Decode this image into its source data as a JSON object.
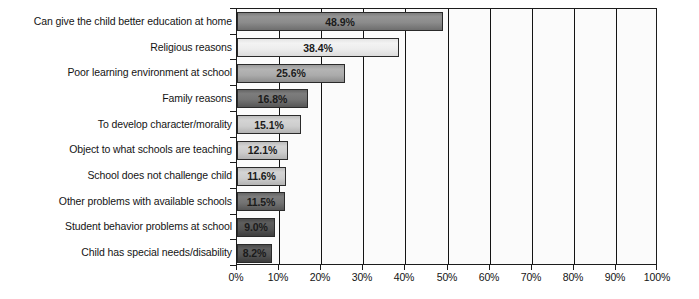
{
  "chart_data": {
    "type": "bar",
    "orientation": "horizontal",
    "title": "",
    "xlabel": "",
    "ylabel": "",
    "xlim": [
      0,
      100
    ],
    "xtick_labels": [
      "0%",
      "10%",
      "20%",
      "30%",
      "40%",
      "50%",
      "60%",
      "70%",
      "80%",
      "90%",
      "100%"
    ],
    "xtick_values": [
      0,
      10,
      20,
      30,
      40,
      50,
      60,
      70,
      80,
      90,
      100
    ],
    "grid": true,
    "legend": null,
    "categories": [
      "Can give the child better education at home",
      "Religious reasons",
      "Poor learning environment at school",
      "Family reasons",
      "To develop character/morality",
      "Object to what schools are teaching",
      "School does not challenge child",
      "Other problems with available schools",
      "Student behavior problems at school",
      "Child has special needs/disability"
    ],
    "values": [
      48.9,
      38.4,
      25.6,
      16.8,
      15.1,
      12.1,
      11.6,
      11.5,
      9.0,
      8.2
    ],
    "value_labels": [
      "48.9%",
      "38.4%",
      "25.6%",
      "16.8%",
      "15.1%",
      "12.1%",
      "11.6%",
      "11.5%",
      "9.0%",
      "8.2%"
    ],
    "bar_styles": [
      "fill-darkgray",
      "fill-lightgray",
      "fill-midgray",
      "fill-deepgray",
      "fill-palegray",
      "fill-palegray",
      "fill-palegray",
      "fill-deepgray",
      "fill-charcoal",
      "fill-charcoal"
    ],
    "colors": {
      "axis": "#1c1c1c",
      "plot_background": "#fbfbfb",
      "gridline": "#141414",
      "text": "#141414"
    }
  }
}
